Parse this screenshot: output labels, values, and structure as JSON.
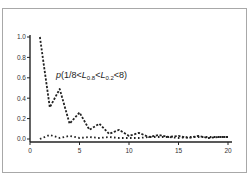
{
  "chart_data": {
    "type": "line",
    "title": "",
    "xlabel": "",
    "ylabel": "",
    "xlim": [
      0,
      20
    ],
    "ylim": [
      0,
      1.0
    ],
    "grid": false,
    "x_ticks": [
      "0",
      "5",
      "10",
      "15",
      "20"
    ],
    "y_ticks": [
      "0.0",
      "0.2",
      "0.4",
      "0.6",
      "0.8",
      "1.0"
    ],
    "x": [
      1,
      2,
      3,
      4,
      5,
      6,
      7,
      8,
      9,
      10,
      11,
      12,
      13,
      14,
      15,
      16,
      17,
      18,
      19,
      20
    ],
    "series": [
      {
        "name": "p(1/8<L0.8<L0.2<8)",
        "style": "dashed",
        "values": [
          1.0,
          0.31,
          0.49,
          0.15,
          0.26,
          0.09,
          0.15,
          0.05,
          0.09,
          0.03,
          0.06,
          0.02,
          0.04,
          0.02,
          0.03,
          0.01,
          0.03,
          0.01,
          0.02,
          0.02
        ]
      },
      {
        "name": "lower series",
        "style": "dotted",
        "values": [
          0.0,
          0.04,
          0.01,
          0.03,
          0.01,
          0.02,
          0.01,
          0.02,
          0.01,
          0.01,
          0.01,
          0.02,
          0.02,
          0.02,
          0.01,
          0.02,
          0.02,
          0.02,
          0.02,
          0.02
        ]
      }
    ],
    "annotations": [
      {
        "text": "p(1/8<L0.8<L0.2<8)",
        "x": 2.5,
        "y": 0.57
      }
    ],
    "legend": "none"
  },
  "annotation": {
    "p": "p",
    "open": "(1/8<",
    "L1": "L",
    "L1_sub": "0.8",
    "mid": "<",
    "L2": "L",
    "L2_sub": "0.2",
    "close": "<8)"
  },
  "colors": {
    "line": "#222222",
    "axis": "#222222",
    "frame": "#a8a8a8"
  }
}
